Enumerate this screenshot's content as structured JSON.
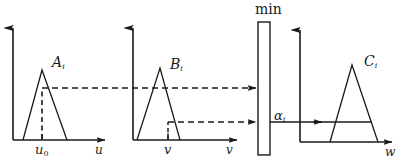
{
  "diagram": {
    "type": "fuzzy-inference",
    "colors": {
      "stroke": "#1a1a1a",
      "background": "#ffffff",
      "dashed": "#1a1a1a"
    }
  },
  "panels": [
    {
      "id": "panel-a",
      "set_label": "A",
      "set_subscript": "i",
      "axis_label": "u",
      "tick_label": "u",
      "tick_subscript": "0",
      "membership_value_line": "dashed",
      "triangle": {
        "left": 23,
        "peak": 42,
        "right": 67,
        "peak_height": 70,
        "baseline": 140
      },
      "alpha_level_y": 88
    },
    {
      "id": "panel-b",
      "set_label": "B",
      "set_subscript": "i",
      "axis_label": "v",
      "tick_label": "v",
      "tick_subscript": "",
      "membership_value_line": "dashed",
      "triangle": {
        "left": 137,
        "peak": 160,
        "right": 180,
        "peak_height": 68,
        "baseline": 140
      },
      "alpha_level_y": 122
    },
    {
      "id": "panel-c",
      "set_label": "C",
      "set_subscript": "i",
      "axis_label": "w",
      "tick_label": "",
      "tick_subscript": "",
      "membership_value_line": "solid",
      "triangle": {
        "left": 330,
        "peak": 352,
        "right": 378,
        "peak_height": 65,
        "baseline": 142
      },
      "alpha_level_y": 122
    }
  ],
  "operator": {
    "label": "min",
    "box": {
      "x": 258,
      "y": 22,
      "width": 12,
      "height": 133
    }
  },
  "result": {
    "alpha_label": "α",
    "alpha_subscript": "i"
  },
  "axis_labels": {
    "u": "u",
    "v": "v",
    "w": "w",
    "u0_base": "u",
    "u0_sub": "0",
    "v_tick": "v"
  },
  "set_labels": {
    "a": "A",
    "b": "B",
    "c": "C",
    "sub_i": "i"
  }
}
